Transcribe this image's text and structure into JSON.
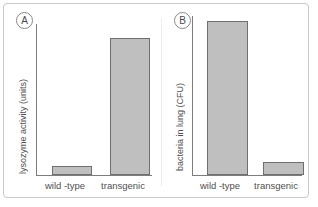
{
  "figure": {
    "panels": [
      {
        "tag": "A",
        "ylabel": "lysozyme activity (units)",
        "categories": [
          "wild -type",
          "transgenic"
        ],
        "values": [
          6,
          91
        ]
      },
      {
        "tag": "B",
        "ylabel": "bacteria in lung (CFU)",
        "categories": [
          "wild -type",
          "transgenic"
        ],
        "values": [
          97,
          8
        ]
      }
    ]
  },
  "style": {
    "bar_fill": "#bfbfbf",
    "bar_stroke": "#6f6f6f",
    "axis_color": "#7d7d7d",
    "frame_color": "#c9c9c9",
    "text_color": "#4f4f4f"
  },
  "chart_data": [
    {
      "type": "bar",
      "panel": "A",
      "title": "",
      "xlabel": "",
      "ylabel": "lysozyme activity (units)",
      "categories": [
        "wild -type",
        "transgenic"
      ],
      "values": [
        6,
        91
      ],
      "ylim": [
        0,
        100
      ],
      "grid": false,
      "legend": "none",
      "axis_ticks": "none"
    },
    {
      "type": "bar",
      "panel": "B",
      "title": "",
      "xlabel": "",
      "ylabel": "bacteria in lung (CFU)",
      "categories": [
        "wild -type",
        "transgenic"
      ],
      "values": [
        97,
        8
      ],
      "ylim": [
        0,
        100
      ],
      "grid": false,
      "legend": "none",
      "axis_ticks": "none"
    }
  ]
}
